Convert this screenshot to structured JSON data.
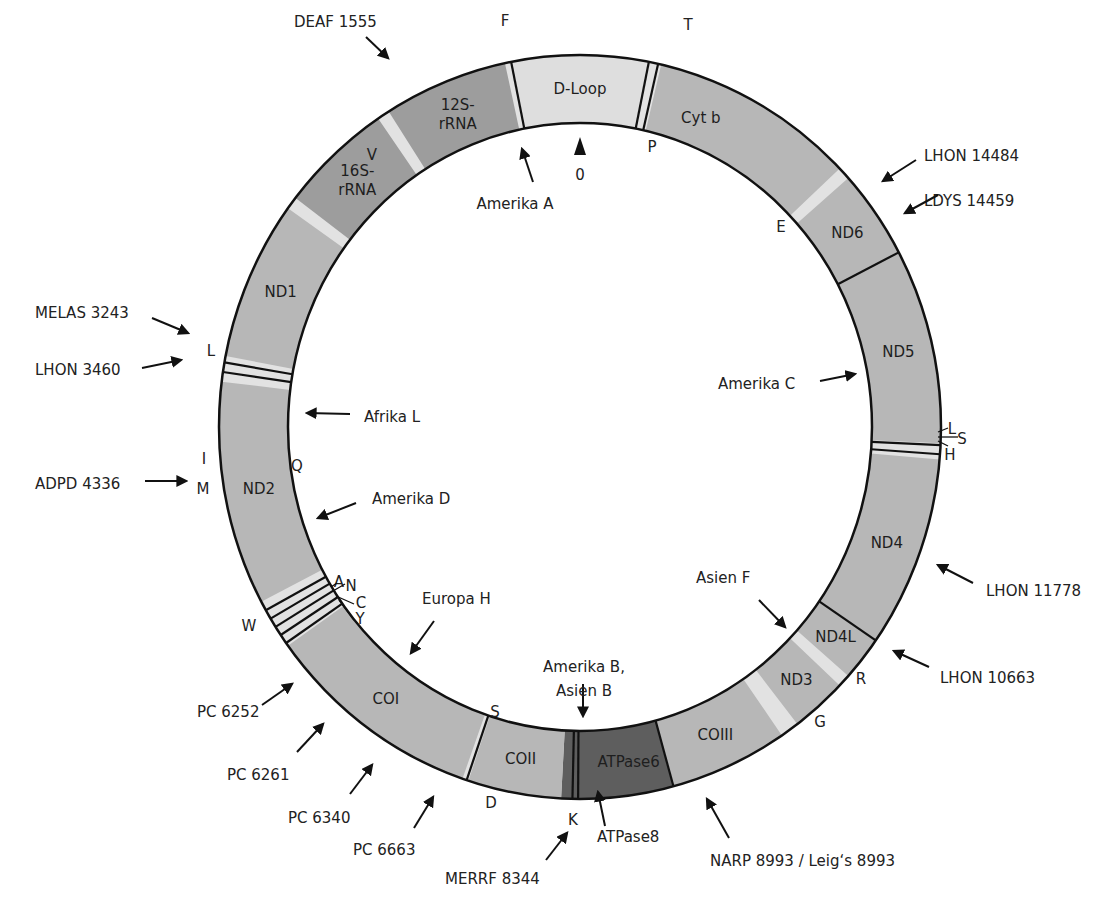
{
  "colors": {
    "rrna": "#9d9d9d",
    "protein": "#b7b7b7",
    "dloop": "#dedede",
    "atpase": "#5e5e5e",
    "trna_gap": "#e2e2e2",
    "outline": "#111111",
    "text": "#222222"
  },
  "origin_label": "0",
  "segments": [
    {
      "name": "D-Loop",
      "start": -11,
      "end": 11,
      "type": "dloop",
      "label": "D-Loop"
    },
    {
      "name": "Cyt b",
      "start": 13,
      "end": 46,
      "type": "protein",
      "label": "Cyt b"
    },
    {
      "name": "ND6",
      "start": 48,
      "end": 62,
      "type": "protein",
      "label": "ND6"
    },
    {
      "name": "ND5",
      "start": 62,
      "end": 92.5,
      "type": "protein",
      "label": "ND5"
    },
    {
      "name": "ND4",
      "start": 95,
      "end": 125,
      "type": "protein",
      "label": "ND4"
    },
    {
      "name": "ND4L",
      "start": 125,
      "end": 132,
      "type": "protein",
      "label": "ND4L"
    },
    {
      "name": "ND3",
      "start": 134,
      "end": 143,
      "type": "protein",
      "label": "ND3"
    },
    {
      "name": "COIII",
      "start": 146,
      "end": 165,
      "type": "protein",
      "label": "COIII"
    },
    {
      "name": "ATPase6",
      "start": 165,
      "end": 180,
      "type": "atpase",
      "label": "ATPase6"
    },
    {
      "name": "ATPase8",
      "start": 180,
      "end": 183,
      "type": "atpase",
      "label": ""
    },
    {
      "name": "COII",
      "start": 183,
      "end": 198,
      "type": "protein",
      "label": "COII"
    },
    {
      "name": "COI",
      "start": 199,
      "end": 234,
      "type": "protein",
      "label": "COI"
    },
    {
      "name": "ND2",
      "start": 242,
      "end": 277,
      "type": "protein",
      "label": "ND2"
    },
    {
      "name": "ND1",
      "start": 281,
      "end": 306,
      "type": "protein",
      "label": "ND1"
    },
    {
      "name": "16S-rRNA",
      "start": 308,
      "end": 326,
      "type": "rrna",
      "label": "16S-\nrRNA"
    },
    {
      "name": "12S-rRNA",
      "start": 328,
      "end": 348,
      "type": "rrna",
      "label": "12S-\nrRNA"
    }
  ],
  "trna_gaps": [
    {
      "name": "F",
      "start": -12.5,
      "end": -11
    },
    {
      "name": "T-P",
      "start": 11,
      "end": 13
    },
    {
      "name": "E",
      "start": 46,
      "end": 48
    },
    {
      "name": "L-S-H",
      "start": 92.5,
      "end": 95
    },
    {
      "name": "R",
      "start": 132,
      "end": 134
    },
    {
      "name": "G",
      "start": 143,
      "end": 146
    },
    {
      "name": "K",
      "start": 181.5,
      "end": 183
    },
    {
      "name": "W-A-N-C-Y",
      "start": 234,
      "end": 242
    },
    {
      "name": "I-Q-M",
      "start": 277,
      "end": 281
    },
    {
      "name": "L",
      "start": 306,
      "end": 308
    },
    {
      "name": "V",
      "start": 326,
      "end": 328
    },
    {
      "name": "12S-end",
      "start": 348,
      "end": 348.8
    }
  ],
  "divider_lines": [
    -11,
    11,
    12.5,
    62,
    92.8,
    94.2,
    125,
    165,
    180.3,
    181.2,
    198.3,
    234.5,
    236,
    237.5,
    239,
    240.5,
    278.5,
    280
  ],
  "trna_labels": [
    {
      "text": "F",
      "x": 505,
      "y": 26
    },
    {
      "text": "T",
      "x": 688,
      "y": 30
    },
    {
      "text": "P",
      "x": 652,
      "y": 152
    },
    {
      "text": "V",
      "x": 372,
      "y": 160
    },
    {
      "text": "E",
      "x": 781,
      "y": 232
    },
    {
      "text": "L",
      "x": 211,
      "y": 356
    },
    {
      "text": "L",
      "x": 952,
      "y": 434
    },
    {
      "text": "S",
      "x": 962,
      "y": 444
    },
    {
      "text": "H",
      "x": 950,
      "y": 460
    },
    {
      "text": "I",
      "x": 204,
      "y": 464
    },
    {
      "text": "Q",
      "x": 297,
      "y": 471
    },
    {
      "text": "M",
      "x": 203,
      "y": 494
    },
    {
      "text": "A",
      "x": 339,
      "y": 587
    },
    {
      "text": "N",
      "x": 351,
      "y": 591
    },
    {
      "text": "C",
      "x": 361,
      "y": 608
    },
    {
      "text": "Y",
      "x": 360,
      "y": 624
    },
    {
      "text": "W",
      "x": 249,
      "y": 631
    },
    {
      "text": "R",
      "x": 861,
      "y": 684
    },
    {
      "text": "G",
      "x": 820,
      "y": 727
    },
    {
      "text": "S",
      "x": 495,
      "y": 717
    },
    {
      "text": "D",
      "x": 491,
      "y": 808
    },
    {
      "text": "K",
      "x": 573,
      "y": 825
    }
  ],
  "annotations": [
    {
      "text": "DEAF 1555",
      "x": 294,
      "y": 27,
      "anchor": "start",
      "arrow": [
        366,
        37,
        388,
        58
      ]
    },
    {
      "text": "Amerika A",
      "x": 515,
      "y": 209,
      "anchor": "middle",
      "arrow": [
        533,
        182,
        522,
        149
      ]
    },
    {
      "text": "LHON 14484",
      "x": 924,
      "y": 161,
      "anchor": "start",
      "arrow": [
        916,
        160,
        883,
        181
      ]
    },
    {
      "text": "LDYS 14459",
      "x": 924,
      "y": 206,
      "anchor": "start",
      "arrow": [
        938,
        195,
        905,
        213
      ]
    },
    {
      "text": "MELAS 3243",
      "x": 35,
      "y": 318,
      "anchor": "start",
      "arrow": [
        152,
        318,
        188,
        333
      ]
    },
    {
      "text": "LHON 3460",
      "x": 35,
      "y": 375,
      "anchor": "start",
      "arrow": [
        142,
        368,
        181,
        360
      ]
    },
    {
      "text": "Amerika C",
      "x": 718,
      "y": 389,
      "anchor": "start",
      "arrow": [
        820,
        381,
        855,
        374
      ]
    },
    {
      "text": "Afrika L",
      "x": 364,
      "y": 422,
      "anchor": "start",
      "arrow": [
        350,
        414,
        307,
        413
      ]
    },
    {
      "text": "ADPD 4336",
      "x": 35,
      "y": 489,
      "anchor": "start",
      "arrow": [
        145,
        481,
        186,
        481
      ]
    },
    {
      "text": "Amerika D",
      "x": 372,
      "y": 504,
      "anchor": "start",
      "arrow": [
        356,
        503,
        318,
        518
      ]
    },
    {
      "text": "Europa H",
      "x": 422,
      "y": 604,
      "anchor": "start",
      "arrow": [
        434,
        621,
        411,
        653
      ]
    },
    {
      "text": "Asien F",
      "x": 696,
      "y": 583,
      "anchor": "start",
      "arrow": [
        759,
        600,
        785,
        627
      ]
    },
    {
      "text": "LHON 11778",
      "x": 986,
      "y": 596,
      "anchor": "start",
      "arrow": [
        973,
        583,
        938,
        565
      ]
    },
    {
      "text": "LHON 10663",
      "x": 940,
      "y": 683,
      "anchor": "start",
      "arrow": [
        929,
        667,
        894,
        651
      ]
    },
    {
      "text": "Amerika B,",
      "x": 584,
      "y": 672,
      "anchor": "middle",
      "arrow": [
        583,
        684,
        583,
        716
      ]
    },
    {
      "text": "Asien B",
      "x": 584,
      "y": 696,
      "anchor": "middle"
    },
    {
      "text": "PC 6252",
      "x": 197,
      "y": 717,
      "anchor": "start",
      "arrow": [
        262,
        705,
        292,
        684
      ]
    },
    {
      "text": "PC 6261",
      "x": 227,
      "y": 780,
      "anchor": "start",
      "arrow": [
        297,
        752,
        323,
        724
      ]
    },
    {
      "text": "PC 6340",
      "x": 288,
      "y": 823,
      "anchor": "start",
      "arrow": [
        350,
        794,
        372,
        765
      ]
    },
    {
      "text": "PC 6663",
      "x": 353,
      "y": 855,
      "anchor": "start",
      "arrow": [
        414,
        828,
        433,
        797
      ]
    },
    {
      "text": "ATPase8",
      "x": 597,
      "y": 842,
      "anchor": "start",
      "arrow": [
        605,
        826,
        598,
        792
      ]
    },
    {
      "text": "MERRF 8344",
      "x": 445,
      "y": 884,
      "anchor": "start",
      "arrow": [
        546,
        860,
        567,
        833
      ]
    },
    {
      "text": "NARP 8993 / Leig‘s 8993",
      "x": 710,
      "y": 866,
      "anchor": "start",
      "arrow": [
        729,
        838,
        707,
        799
      ]
    }
  ]
}
